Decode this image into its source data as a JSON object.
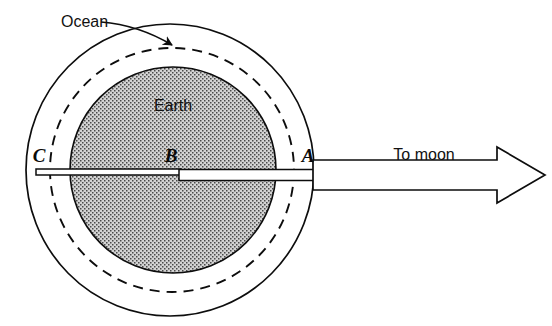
{
  "figure": {
    "background_color": "#ffffff",
    "line_color": "#0d0d0d",
    "earth_fill_color": "#b9b9b9",
    "earth_stipple_color": "#5c5c5c"
  },
  "labels": {
    "ocean": "Ocean",
    "earth": "Earth",
    "point_c": "C",
    "point_b": "B",
    "point_a": "A",
    "to_moon": "To moon"
  },
  "geometry": {
    "earth_circle": {
      "cx": 173,
      "cy": 170,
      "r": 103
    },
    "ocean_ellipse": {
      "cx": 170,
      "cy": 170,
      "rx": 144,
      "ry": 146
    },
    "dashed_circle": {
      "cx": 172,
      "cy": 170,
      "r": 122
    },
    "axis_left": {
      "x1": 36,
      "x2": 178,
      "y": 172,
      "thickness": 6
    },
    "axis_right": {
      "x1": 178,
      "x2": 315,
      "y": 174,
      "thickness": 11
    },
    "moon_arrow": {
      "x_start": 313,
      "x_end": 545,
      "y": 175,
      "shaft_half_height": 15,
      "head_length": 48,
      "head_half_height": 28
    },
    "ocean_leader": {
      "from_x": 100,
      "from_y": 21,
      "to_x": 173,
      "to_y": 46
    }
  }
}
